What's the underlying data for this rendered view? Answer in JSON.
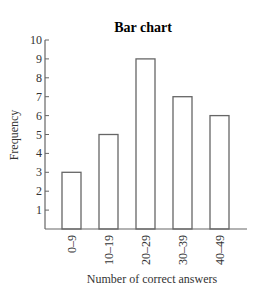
{
  "chart_data": {
    "type": "bar",
    "title": "Bar chart",
    "xlabel": "Number of correct answers",
    "ylabel": "Frequency",
    "categories": [
      "0–9",
      "10–19",
      "20–29",
      "30–39",
      "40–49"
    ],
    "values": [
      3,
      5,
      9,
      7,
      6
    ],
    "ylim": [
      0,
      10
    ],
    "yticks": [
      1,
      2,
      3,
      4,
      5,
      6,
      7,
      8,
      9,
      10
    ],
    "grid": false,
    "legend": null,
    "bar_fill": "#ffffff",
    "bar_stroke": "#666666"
  }
}
